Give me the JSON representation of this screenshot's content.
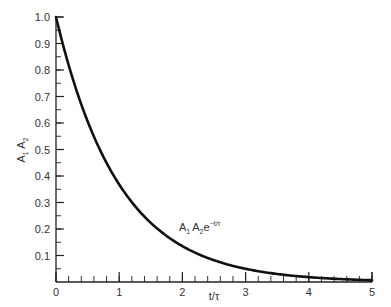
{
  "chart_data": {
    "type": "line",
    "title": "",
    "xlabel": "t/τ",
    "ylabel": "A₁ A₂",
    "xlim": [
      0,
      5
    ],
    "ylim": [
      0,
      1.0
    ],
    "grid": false,
    "legend": "none",
    "x_major_ticks": [
      0,
      1,
      2,
      3,
      4,
      5
    ],
    "x_tick_labels": [
      "0",
      "1",
      "2",
      "3",
      "4",
      "5"
    ],
    "x_minor_step": 0.2,
    "y_major_ticks": [
      0.1,
      0.2,
      0.3,
      0.4,
      0.5,
      0.6,
      0.7,
      0.8,
      0.9,
      1.0
    ],
    "y_tick_labels": [
      "0.1",
      "0.2",
      "0.3",
      "0.4",
      "0.5",
      "0.6",
      "0.7",
      "0.8",
      "0.9",
      "1.0"
    ],
    "y_minor_step": 0.05,
    "series": [
      {
        "name": "A₁ A₂ e^(−t/τ)",
        "function": "exp(-x)",
        "x": [
          0,
          0.5,
          1,
          1.5,
          2,
          2.5,
          3,
          3.5,
          4,
          4.5,
          5
        ],
        "values": [
          1.0,
          0.607,
          0.368,
          0.223,
          0.135,
          0.082,
          0.05,
          0.03,
          0.018,
          0.011,
          0.007
        ]
      }
    ],
    "annotations": [
      {
        "text": "A₁ A₂e⁻ᵗᐟᵀ",
        "x": 2.0,
        "y": 0.16
      }
    ]
  },
  "labels": {
    "x_axis": "t/τ",
    "y_axis_a1": "A",
    "y_axis_sub1": "1",
    "y_axis_a2": "A",
    "y_axis_sub2": "2",
    "curve_main_a1": "A",
    "curve_sub1": "1",
    "curve_main_a2": "A",
    "curve_sub2": "2",
    "curve_e": "e",
    "curve_exp": "−t/τ"
  }
}
